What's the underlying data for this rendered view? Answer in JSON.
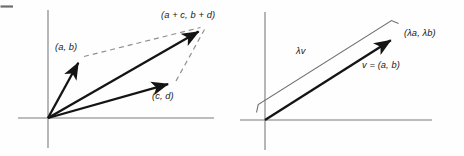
{
  "figure": {
    "background_color": "#fefefe",
    "ink_color": "#141414",
    "axis_color": "#7b7b7b",
    "dash_color": "#8d8d8d",
    "width": 464,
    "height": 156,
    "top_left_rule": "horizontal-rule-mark"
  },
  "left_panel": {
    "name": "vector-addition-panel",
    "labels": {
      "sum_vector": "(a + c, b + d)",
      "vector_ab": "(a, b)",
      "vector_cd": "(c, d)"
    },
    "axes": {
      "origin": [
        48,
        118
      ],
      "x_axis": [
        18,
        118,
        214,
        118
      ],
      "y_axis": [
        48,
        10,
        48,
        148
      ]
    },
    "vectors": [
      {
        "name": "vector-ab",
        "from": [
          48,
          118
        ],
        "to": [
          81,
          58
        ],
        "style": "solid-arrow"
      },
      {
        "name": "vector-cd",
        "from": [
          48,
          118
        ],
        "to": [
          172,
          83
        ],
        "style": "solid-arrow"
      },
      {
        "name": "vector-sum",
        "from": [
          48,
          118
        ],
        "to": [
          203,
          27
        ],
        "style": "solid-arrow"
      }
    ],
    "dashed_lines": [
      {
        "name": "parallelogram-edge-top",
        "from": [
          83,
          57
        ],
        "to": [
          201,
          27
        ]
      },
      {
        "name": "parallelogram-edge-right",
        "from": [
          175,
          82
        ],
        "to": [
          205,
          29
        ]
      }
    ]
  },
  "right_panel": {
    "name": "scalar-multiple-panel",
    "labels": {
      "scaled_point": "(λa, λb)",
      "scaled_vector": "λv",
      "base_vector": "v = (a, b)"
    },
    "axes": {
      "origin": [
        265,
        120
      ],
      "x_axis": [
        240,
        120,
        432,
        120
      ],
      "y_axis": [
        265,
        12,
        265,
        150
      ]
    },
    "vectors": [
      {
        "name": "vector-v",
        "from": [
          265,
          120
        ],
        "to": [
          395,
          37
        ],
        "style": "solid-arrow"
      },
      {
        "name": "vector-lambda-v",
        "from": [
          265,
          120
        ],
        "to": [
          404,
          32
        ],
        "style": "brace-outline"
      }
    ],
    "brace": {
      "name": "lambda-v-brace",
      "points": [
        [
          257,
          113
        ],
        [
          259,
          106
        ],
        [
          392,
          21
        ],
        [
          399,
          23
        ]
      ]
    }
  }
}
